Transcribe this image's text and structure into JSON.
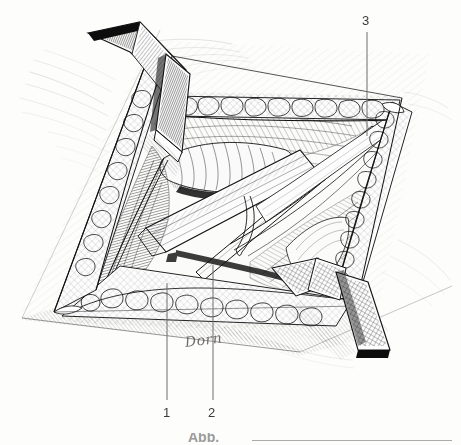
{
  "figure": {
    "kind": "surgical-anatomy-line-drawing",
    "medium": "pen-and-ink hatching",
    "background_color": "#fdfdfc",
    "ink_color": "#1a1a1a",
    "width": 461,
    "height": 445
  },
  "labels": [
    {
      "id": "1",
      "text": "1",
      "x": 163,
      "y": 406,
      "leader_x": 167,
      "leader_top": 283,
      "leader_bottom": 400
    },
    {
      "id": "2",
      "text": "2",
      "x": 208,
      "y": 406,
      "leader_x": 213,
      "leader_top": 265,
      "leader_bottom": 400
    },
    {
      "id": "3",
      "text": "3",
      "x": 362,
      "y": 14,
      "leader_x": 367,
      "leader_top": 32,
      "leader_bottom": 136
    }
  ],
  "signature": {
    "text": "Dorn",
    "style": "handwritten italic script"
  },
  "caption": {
    "text": "Abb.",
    "visible": "cropped at bottom edge"
  },
  "instruments": [
    {
      "name": "langenbeck-retractor-upper-left",
      "description": "hand-held retractor blade with dense line hatching, hooking the upper-left wound margin"
    },
    {
      "name": "langenbeck-retractor-lower-right",
      "description": "hand-held retractor blade with cross hatching, hooking the lower-right wound margin"
    },
    {
      "name": "flat-elevator-blade",
      "description": "broad flat instrument crossing the field diagonally"
    },
    {
      "name": "nerve-hook-loop",
      "description": "thin wire loop slung beneath a structure in the depth of the wound"
    }
  ],
  "tissues": [
    {
      "name": "skin-surface",
      "description": "feathered stipple hatching outside the incision"
    },
    {
      "name": "subcutaneous-fat",
      "description": "lobular bubble texture lining both wound margins"
    },
    {
      "name": "fascia-muscle-bed",
      "description": "parallel fibre hatching in the floor of the wound"
    },
    {
      "name": "tendon-structures",
      "description": "pale glossy bands in the centre of the exposure"
    }
  ]
}
